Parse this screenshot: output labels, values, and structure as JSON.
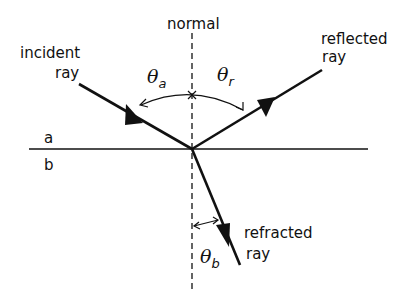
{
  "diagram": {
    "labels": {
      "normal": "normal",
      "incident_line1": "incident",
      "incident_line2": "ray",
      "reflected_line1": "reflected",
      "reflected_line2": "ray",
      "refracted_line1": "refracted",
      "refracted_line2": "ray",
      "medium_a": "a",
      "medium_b": "b"
    },
    "angles": {
      "incident": {
        "symbol": "θ",
        "subscript": "a"
      },
      "reflected": {
        "symbol": "θ",
        "subscript": "r"
      },
      "refracted": {
        "symbol": "θ",
        "subscript": "b"
      }
    },
    "colors": {
      "line": "#111111",
      "background": "#ffffff"
    }
  }
}
